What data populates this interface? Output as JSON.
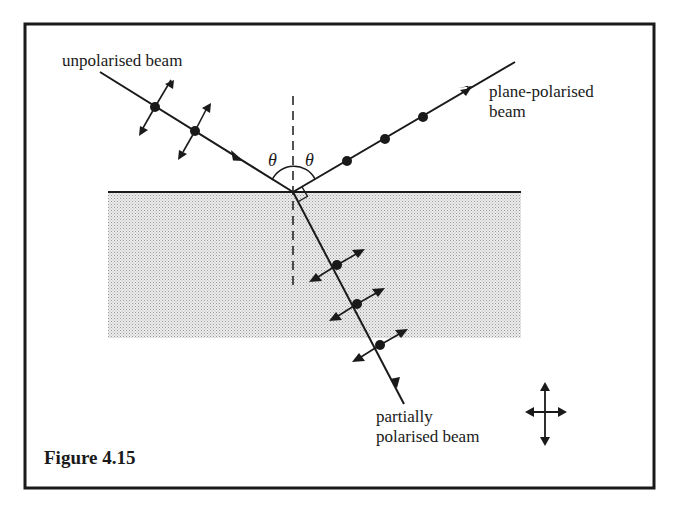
{
  "figure": {
    "caption": "Figure 4.15",
    "labels": {
      "incident": "unpolarised beam",
      "reflected_line1": "plane-polarised",
      "reflected_line2": "beam",
      "refracted_line1": "partially",
      "refracted_line2": "polarised beam",
      "angle_left": "θ",
      "angle_right": "θ"
    },
    "colors": {
      "ink": "#1a1a1a",
      "medium_fill": "#d9d9d9",
      "background": "#ffffff"
    },
    "elements": {
      "incident_polarisation_markers": 2,
      "reflected_dot_markers": 3,
      "refracted_polarisation_markers": 3
    }
  }
}
